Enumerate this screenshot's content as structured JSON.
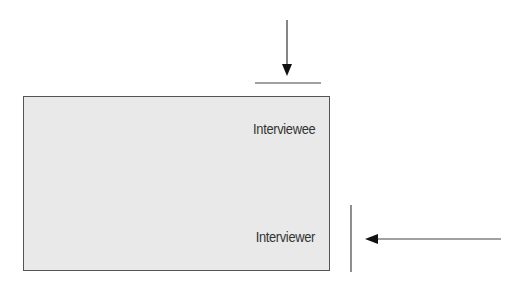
{
  "diagram": {
    "box": {
      "fill": "#e9e9e9",
      "stroke": "#555555"
    },
    "labels": {
      "top": "Interviewee",
      "bottom": "Interviewer"
    },
    "arrows": [
      {
        "name": "arrow-down",
        "direction": "down",
        "from": [
          287,
          20
        ],
        "to": [
          287,
          75
        ]
      },
      {
        "name": "arrow-left",
        "direction": "left",
        "from": [
          501,
          239
        ],
        "to": [
          366,
          239
        ]
      }
    ],
    "edge_markers": [
      {
        "name": "top-marker-line",
        "orientation": "horizontal"
      },
      {
        "name": "right-marker-line",
        "orientation": "vertical"
      }
    ],
    "line_color": "#333333"
  }
}
